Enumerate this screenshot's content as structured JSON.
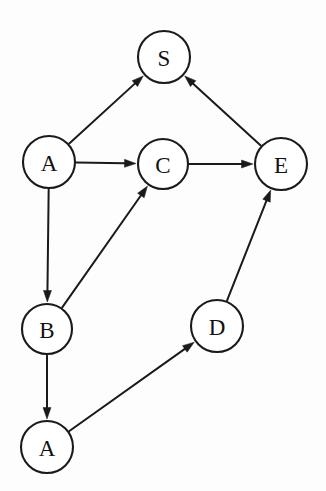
{
  "diagram": {
    "background_color": "#fdfdfd",
    "stroke_color": "#1a1a1a",
    "node_fill": "#ffffff",
    "width": 326,
    "height": 491,
    "nodes": [
      {
        "id": "S",
        "label": "S",
        "cx": 164,
        "cy": 57,
        "r": 26
      },
      {
        "id": "A1",
        "label": "A",
        "cx": 49,
        "cy": 162,
        "r": 26
      },
      {
        "id": "C",
        "label": "C",
        "cx": 163,
        "cy": 164,
        "r": 25
      },
      {
        "id": "E",
        "label": "E",
        "cx": 281,
        "cy": 164,
        "r": 26
      },
      {
        "id": "B",
        "label": "B",
        "cx": 47,
        "cy": 329,
        "r": 25
      },
      {
        "id": "D",
        "label": "D",
        "cx": 217,
        "cy": 326,
        "r": 26
      },
      {
        "id": "A2",
        "label": "A",
        "cx": 47,
        "cy": 447,
        "r": 26
      }
    ],
    "edges": [
      {
        "from": "A1",
        "to": "S",
        "directed": true
      },
      {
        "from": "E",
        "to": "S",
        "directed": true
      },
      {
        "from": "A1",
        "to": "C",
        "directed": true
      },
      {
        "from": "C",
        "to": "E",
        "directed": true
      },
      {
        "from": "A1",
        "to": "B",
        "directed": true
      },
      {
        "from": "B",
        "to": "C",
        "directed": true
      },
      {
        "from": "B",
        "to": "A2",
        "directed": true
      },
      {
        "from": "A2",
        "to": "D",
        "directed": true
      },
      {
        "from": "D",
        "to": "E",
        "directed": true
      }
    ]
  }
}
